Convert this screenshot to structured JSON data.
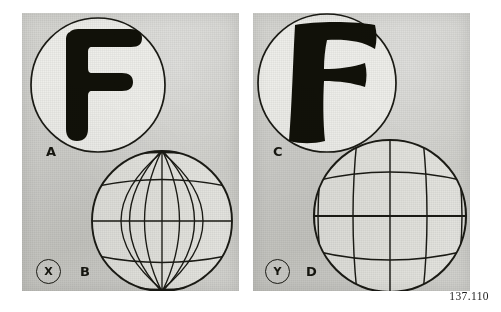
{
  "figure": {
    "caption_number": "137.110",
    "background_color": "#ffffff",
    "panel_tone": "#d0d0cb",
    "ink_color": "#15150f"
  },
  "panels": [
    {
      "id": "left",
      "marker": "X",
      "marker_name": "panel-marker-x",
      "items": [
        {
          "label": "A",
          "kind": "letter-in-circle",
          "letter": "F",
          "letter_style": "rounded-sans-serif-undistorted",
          "description": "Heavy rounded sans-serif letter F inside a thin outlined circle"
        },
        {
          "label": "B",
          "kind": "globe-graticule",
          "globe_style": "regular-graticule",
          "meridians": 7,
          "parallels": 5,
          "description": "Sphere with regular latitude-longitude grid, meridians converging at poles"
        }
      ]
    },
    {
      "id": "right",
      "marker": "Y",
      "marker_name": "panel-marker-y",
      "items": [
        {
          "label": "C",
          "kind": "letter-in-circle",
          "letter": "F",
          "letter_style": "flared-distorted-serif",
          "description": "Heavy flared letter F with concave curved arm ends inside a thin outlined circle"
        },
        {
          "label": "D",
          "kind": "globe-graticule",
          "globe_style": "barrel-distorted-grid",
          "meridians": 7,
          "parallels": 5,
          "description": "Sphere with barrel-distorted grid, lines bulging outward and not converging at poles"
        }
      ]
    }
  ]
}
